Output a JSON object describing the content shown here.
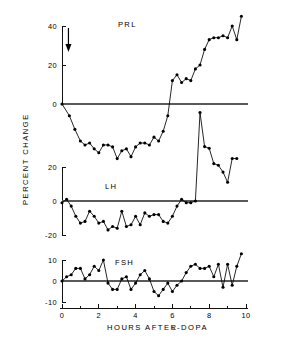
{
  "figure": {
    "y_axis_title": "PERCENT CHANGE",
    "x_axis_title_main": "HOURS AFTER",
    "x_axis_title_prefix": "L",
    "x_axis_title_suffix": "-DOPA",
    "colors": {
      "ink": "#000000",
      "zero_line": "#5a5a5a",
      "background": "#ffffff"
    },
    "annotations": {
      "dose_arrow": {
        "name": "l-dopa-dose-arrow",
        "x_hours": 0.35,
        "description": "downward arrow marking L-DOPA administration"
      }
    }
  },
  "chart_data": [
    {
      "type": "line",
      "title": "PRL",
      "panel": "top",
      "xlabel": "HOURS AFTER L-DOPA",
      "ylabel": "PERCENT CHANGE",
      "xlim": [
        0,
        10
      ],
      "ylim": [
        -32,
        47
      ],
      "yticks": [
        40,
        20,
        0
      ],
      "ytick_labels": [
        "40",
        "20",
        "0"
      ],
      "grid": false,
      "legend": "none",
      "markers": true,
      "x": [
        0.0,
        0.4,
        0.7,
        1.0,
        1.25,
        1.5,
        1.75,
        2.0,
        2.25,
        2.5,
        2.75,
        3.0,
        3.25,
        3.5,
        3.75,
        4.0,
        4.25,
        4.5,
        4.75,
        5.0,
        5.25,
        5.5,
        5.75,
        6.0,
        6.25,
        6.5,
        6.75,
        7.0,
        7.25,
        7.5,
        7.75,
        8.0,
        8.25,
        8.5,
        8.75,
        9.0,
        9.25,
        9.5,
        9.75
      ],
      "values": [
        0,
        -6,
        -13,
        -19,
        -21,
        -20,
        -23,
        -25,
        -21,
        -21,
        -22,
        -28,
        -24,
        -23,
        -27,
        -22,
        -20,
        -20,
        -21,
        -17,
        -19,
        -14,
        -6,
        12,
        15,
        11,
        13,
        12,
        18,
        20,
        28,
        33,
        34,
        34,
        35,
        34,
        40,
        33,
        45
      ]
    },
    {
      "type": "line",
      "title": "LH",
      "panel": "middle",
      "xlabel": "HOURS AFTER L-DOPA",
      "ylabel": "PERCENT CHANGE",
      "xlim": [
        0,
        10
      ],
      "ylim": [
        -22,
        55
      ],
      "yticks": [
        20,
        0,
        -20
      ],
      "ytick_labels": [
        "20",
        "0",
        "-20"
      ],
      "grid": false,
      "legend": "none",
      "markers": true,
      "x": [
        0.0,
        0.25,
        0.5,
        0.75,
        1.0,
        1.25,
        1.5,
        1.75,
        2.0,
        2.25,
        2.5,
        2.75,
        3.0,
        3.25,
        3.5,
        3.75,
        4.0,
        4.25,
        4.5,
        4.75,
        5.0,
        5.25,
        5.5,
        5.75,
        6.0,
        6.25,
        6.5,
        6.75,
        7.0,
        7.25,
        7.5,
        7.75,
        8.0,
        8.25,
        8.5,
        8.75,
        9.0,
        9.25,
        9.5
      ],
      "values": [
        -1,
        1,
        -3,
        -9,
        -13,
        -12,
        -6,
        -9,
        -13,
        -12,
        -17,
        -15,
        -16,
        -6,
        -15,
        -14,
        -9,
        -14,
        -7,
        -9,
        -8,
        -8,
        -12,
        -13,
        -9,
        -3,
        1,
        -1,
        -1,
        0,
        52,
        32,
        31,
        22,
        21,
        17,
        11,
        25,
        25
      ]
    },
    {
      "type": "line",
      "title": "FSH",
      "panel": "bottom",
      "xlabel": "HOURS AFTER L-DOPA",
      "ylabel": "PERCENT CHANGE",
      "xlim": [
        0,
        10
      ],
      "ylim": [
        -12,
        15
      ],
      "yticks": [
        10,
        0,
        -10
      ],
      "ytick_labels": [
        "10",
        "0",
        "-10"
      ],
      "grid": false,
      "legend": "none",
      "markers": true,
      "x": [
        0.0,
        0.25,
        0.5,
        0.75,
        1.0,
        1.25,
        1.5,
        1.75,
        2.0,
        2.25,
        2.5,
        2.75,
        3.0,
        3.25,
        3.5,
        3.75,
        4.0,
        4.25,
        4.5,
        4.75,
        5.0,
        5.25,
        5.5,
        5.75,
        6.0,
        6.25,
        6.5,
        6.75,
        7.0,
        7.25,
        7.5,
        7.75,
        8.0,
        8.25,
        8.5,
        8.75,
        9.0,
        9.25,
        9.5,
        9.75
      ],
      "values": [
        0,
        2,
        3,
        6,
        6,
        1,
        3,
        7,
        5,
        10,
        -1,
        -4,
        -4,
        1,
        2,
        -4,
        -1,
        3,
        5,
        1,
        -5,
        -7,
        -4,
        -1,
        -5,
        -2,
        0,
        4,
        7,
        8,
        6,
        6,
        7,
        2,
        8,
        -3,
        8,
        -2,
        7,
        13
      ]
    }
  ],
  "xaxis": {
    "ticks": [
      0,
      1,
      2,
      3,
      4,
      5,
      6,
      7,
      8,
      9,
      10
    ],
    "major_ticks": [
      0,
      2,
      4,
      6,
      8,
      10
    ],
    "labels": [
      "0",
      "2",
      "4",
      "6",
      "8",
      "10"
    ]
  }
}
